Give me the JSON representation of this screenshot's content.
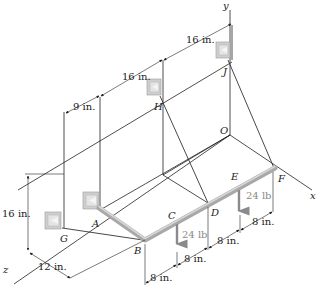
{
  "figure": {
    "type": "3D statics diagram - bent pipe supported by brackets and cables",
    "axes": {
      "x_label": "x",
      "y_label": "y",
      "z_label": "z",
      "origin_label": "O"
    },
    "points": {
      "A": "A",
      "B": "B",
      "C": "C",
      "D": "D",
      "E": "E",
      "F": "F",
      "G": "G",
      "H": "H",
      "J": "J",
      "O": "O"
    },
    "dimensions": {
      "top_16": "16 in.",
      "mid_16": "16 in.",
      "nine": "9 in.",
      "height_16": "16 in.",
      "twelve": "12 in.",
      "bottom_8_1": "8 in.",
      "bottom_8_2": "8 in.",
      "bottom_8_3": "8 in.",
      "bottom_8_4": "8 in."
    },
    "loads": {
      "load_C": "24 lb",
      "load_E": "24 lb"
    },
    "colors": {
      "line": "#222222",
      "pipe": "#a8a8a8",
      "load_arrow": "#8a8a8a",
      "bracket": "#c8c8c8"
    }
  }
}
